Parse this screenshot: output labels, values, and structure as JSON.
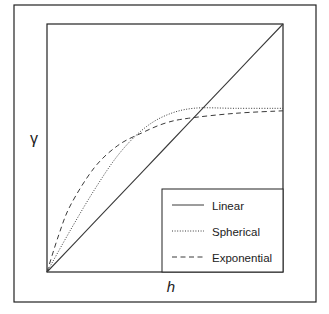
{
  "chart_data": {
    "type": "line",
    "title": "",
    "xlabel": "h",
    "ylabel": "γ",
    "xlim": [
      0,
      1
    ],
    "ylim": [
      0,
      1
    ],
    "grid": false,
    "ticks": false,
    "legend_position": "lower right",
    "series": [
      {
        "name": "Linear",
        "style": "solid",
        "x": [
          0,
          0.2,
          0.4,
          0.6,
          0.8,
          1.0
        ],
        "y": [
          0,
          0.2,
          0.4,
          0.6,
          0.8,
          1.0
        ]
      },
      {
        "name": "Spherical",
        "style": "dotted",
        "x": [
          0,
          0.1,
          0.2,
          0.3,
          0.4,
          0.5,
          0.62,
          0.8,
          1.0
        ],
        "y": [
          0,
          0.17,
          0.33,
          0.47,
          0.57,
          0.63,
          0.66,
          0.66,
          0.66
        ]
      },
      {
        "name": "Exponential",
        "style": "dashed",
        "x": [
          0,
          0.05,
          0.1,
          0.2,
          0.3,
          0.4,
          0.5,
          0.6,
          0.8,
          1.0
        ],
        "y": [
          0,
          0.15,
          0.27,
          0.42,
          0.51,
          0.56,
          0.6,
          0.62,
          0.64,
          0.65
        ]
      }
    ]
  },
  "axes": {
    "x_label": "h",
    "y_label": "γ"
  },
  "legend": {
    "items": [
      {
        "label": "Linear",
        "style": "solid"
      },
      {
        "label": "Spherical",
        "style": "dotted"
      },
      {
        "label": "Exponential",
        "style": "dashed"
      }
    ]
  },
  "colors": {
    "line": "#3a3a3a",
    "frame": "#222222",
    "background": "#ffffff"
  }
}
